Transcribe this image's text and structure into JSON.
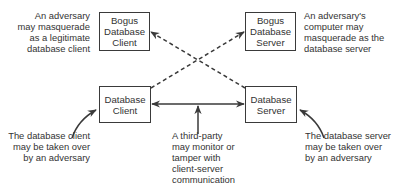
{
  "boxes": {
    "bogus_client": "Bogus\nDatabase\nClient",
    "bogus_server": "Bogus\nDatabase\nServer",
    "db_client": "Database\nClient",
    "db_server": "Database\nServer"
  },
  "notes": {
    "bogus_client": "An adversary\nmay masquerade\nas a legitimate\ndatabase client",
    "bogus_server": "An adversary's\ncomputer may\nmasquerade as the\ndatabase server",
    "db_client": "The database client\nmay be taken over\nby an adversary",
    "third_party": "A third-party\nmay monitor or\ntamper with\nclient-server\ncommunication",
    "db_server": "The database server\nmay be taken over\nby an adversary"
  },
  "colors": {
    "line": "#3a3a3a",
    "text": "#333333"
  }
}
